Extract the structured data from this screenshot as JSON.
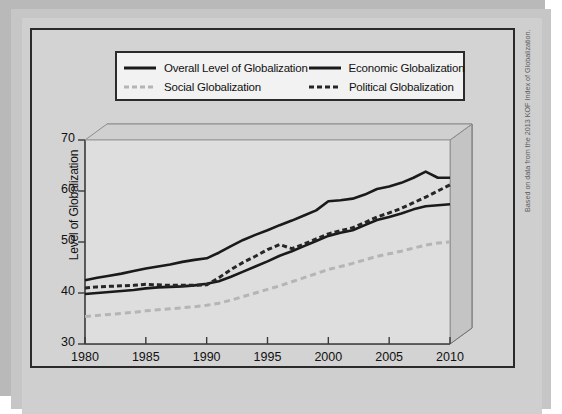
{
  "legend": {
    "items": [
      {
        "label": "Overall Level of Globalization",
        "style": "solid-dark",
        "color": "#1a1a1a"
      },
      {
        "label": "Economic Globalization",
        "style": "solid-dark",
        "color": "#1a1a1a"
      },
      {
        "label": "Social Globalization",
        "style": "dashed-light",
        "color": "#b5b5b5"
      },
      {
        "label": "Political Globalization",
        "style": "dashed-dark",
        "color": "#262626"
      }
    ]
  },
  "source_note": "Based on data from the 2013 KOF Index of Globalization.",
  "chart_data": {
    "type": "line",
    "title": "",
    "xlabel": "",
    "ylabel": "Level of Globalization",
    "xlim": [
      1980,
      2010
    ],
    "ylim": [
      30,
      70
    ],
    "xticks": [
      1980,
      1985,
      1990,
      1995,
      2000,
      2005,
      2010
    ],
    "yticks": [
      30,
      40,
      50,
      60,
      70
    ],
    "grid": false,
    "legend_position": "top",
    "x": [
      1980,
      1981,
      1982,
      1983,
      1984,
      1985,
      1986,
      1987,
      1988,
      1989,
      1990,
      1991,
      1992,
      1993,
      1994,
      1995,
      1996,
      1997,
      1998,
      1999,
      2000,
      2001,
      2002,
      2003,
      2004,
      2005,
      2006,
      2007,
      2008,
      2009,
      2010
    ],
    "series": [
      {
        "name": "Overall Level of Globalization",
        "style": "solid-dark",
        "color": "#1a1a1a",
        "values": [
          39.8,
          40.0,
          40.2,
          40.4,
          40.6,
          40.9,
          41.1,
          41.2,
          41.3,
          41.5,
          41.8,
          42.3,
          43.2,
          44.2,
          45.2,
          46.2,
          47.3,
          48.2,
          49.2,
          50.2,
          51.2,
          51.8,
          52.3,
          53.3,
          54.3,
          54.9,
          55.6,
          56.4,
          57.0,
          57.2,
          57.4
        ]
      },
      {
        "name": "Economic Globalization",
        "style": "solid-dark",
        "color": "#1a1a1a",
        "values": [
          42.5,
          43.0,
          43.4,
          43.8,
          44.3,
          44.8,
          45.2,
          45.6,
          46.1,
          46.5,
          46.8,
          47.9,
          49.2,
          50.4,
          51.4,
          52.3,
          53.3,
          54.2,
          55.2,
          56.2,
          58.0,
          58.2,
          58.5,
          59.3,
          60.4,
          60.9,
          61.6,
          62.6,
          63.8,
          62.6,
          62.6
        ]
      },
      {
        "name": "Social Globalization",
        "style": "dashed-light",
        "color": "#b5b5b5",
        "values": [
          35.4,
          35.6,
          35.8,
          36.0,
          36.2,
          36.5,
          36.7,
          36.9,
          37.1,
          37.3,
          37.6,
          38.0,
          38.6,
          39.3,
          40.0,
          40.7,
          41.4,
          42.2,
          43.0,
          43.8,
          44.6,
          45.2,
          45.8,
          46.5,
          47.2,
          47.7,
          48.2,
          48.8,
          49.4,
          49.8,
          50.0
        ]
      },
      {
        "name": "Political Globalization",
        "style": "dashed-dark",
        "color": "#262626",
        "values": [
          41.0,
          41.2,
          41.3,
          41.4,
          41.5,
          41.7,
          41.6,
          41.5,
          41.5,
          41.5,
          41.6,
          43.0,
          44.6,
          46.0,
          47.2,
          48.5,
          49.5,
          48.7,
          49.6,
          50.6,
          51.6,
          52.2,
          52.8,
          53.8,
          54.9,
          55.7,
          56.6,
          57.7,
          58.8,
          60.0,
          61.2
        ]
      }
    ]
  }
}
